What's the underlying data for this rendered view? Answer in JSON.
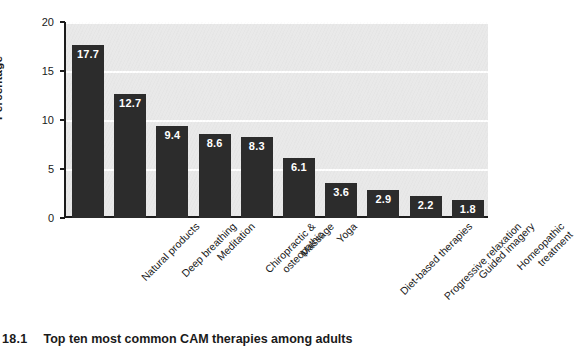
{
  "caption": {
    "figure_number": "18.1",
    "text": "Top ten most common CAM therapies among adults"
  },
  "chart_data": {
    "type": "bar",
    "title": "",
    "subtitle": "",
    "xlabel": "",
    "ylabel": "Percentage",
    "ylim": [
      0,
      20
    ],
    "yticks": [
      "0",
      "5",
      "10",
      "15",
      "20"
    ],
    "ytick_values": [
      0,
      5,
      10,
      15,
      20
    ],
    "grid": "horizontal-white-on-gray",
    "legend": "none",
    "bar_color": "#2c2c2c",
    "plot_background": "#e9e9e9",
    "gridline_color": "#ffffff",
    "axis_color": "#1c1c1c",
    "value_label_color": "#ffffff",
    "categories": [
      "Natural products",
      "Deep breathing",
      "Meditation",
      "Chiropractic & osteopathic",
      "Massage",
      "Yoga",
      "Diet-based therapies",
      "Progressive relaxation",
      "Guided imagery",
      "Homeopathic treatment"
    ],
    "category_lines": [
      [
        "Natural products"
      ],
      [
        "Deep breathing"
      ],
      [
        "Meditation"
      ],
      [
        "Chiropractic &",
        "osteopathic"
      ],
      [
        "Massage"
      ],
      [
        "Yoga"
      ],
      [
        "Diet-based therapies"
      ],
      [
        "Progressive relaxation"
      ],
      [
        "Guided imagery"
      ],
      [
        "Homeopathic",
        "treatment"
      ]
    ],
    "values": [
      17.7,
      12.7,
      9.4,
      8.6,
      8.3,
      6.1,
      3.6,
      2.9,
      2.2,
      1.8
    ],
    "value_labels": [
      "17.7",
      "12.7",
      "9.4",
      "8.6",
      "8.3",
      "6.1",
      "3.6",
      "2.9",
      "2.2",
      "1.8"
    ]
  }
}
